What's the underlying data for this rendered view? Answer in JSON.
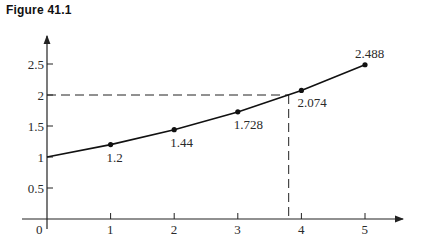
{
  "figure": {
    "title": "Figure 41.1"
  },
  "chart_data": {
    "type": "line",
    "title": "Figure 41.1",
    "xlabel": "",
    "ylabel": "",
    "x": [
      0,
      1,
      2,
      3,
      4,
      5
    ],
    "series": [
      {
        "name": "values",
        "values": [
          1,
          1.2,
          1.44,
          1.728,
          2.074,
          2.488
        ]
      }
    ],
    "point_labels": [
      "",
      "1.2",
      "1.44",
      "1.728",
      "2.074",
      "2.488"
    ],
    "x_ticks": [
      "0",
      "1",
      "2",
      "3",
      "4",
      "5"
    ],
    "y_ticks": [
      "0.5",
      "1",
      "1.5",
      "2",
      "2.5"
    ],
    "xlim": [
      0,
      5.6
    ],
    "ylim": [
      0,
      2.9
    ],
    "grid": false,
    "legend": null,
    "annotations": [
      {
        "type": "dashed-guide",
        "description": "horizontal dashed line at y=2 from y-axis to curve, vertical dashed line down to x≈3.8",
        "x": 3.8,
        "y": 2
      }
    ]
  }
}
